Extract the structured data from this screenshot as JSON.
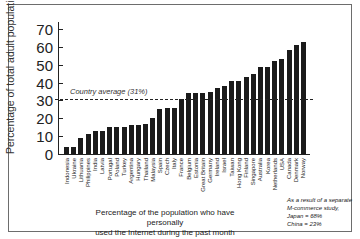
{
  "chart_data": {
    "type": "bar",
    "title": "",
    "xlabel": "Percentage of the population who have personally used the Internet during the past month",
    "xlabel_lines": [
      "Percentage of the population who have personally",
      "used the Internet during the past month"
    ],
    "ylabel": "Percentage of total adult population",
    "ylim": [
      0,
      70
    ],
    "yticks": [
      0,
      10,
      20,
      30,
      40,
      50,
      60,
      70
    ],
    "grid": false,
    "categories": [
      "Indonesia",
      "Ukraine",
      "Lithuania",
      "Philippines",
      "India",
      "Latvia",
      "Portugal",
      "Poland",
      "Turkey",
      "Argentina",
      "Hungary",
      "Thailand",
      "Malaysia",
      "Spain",
      "Czech",
      "Italy",
      "France",
      "Belgium",
      "Estonia",
      "Great Britain",
      "Germany",
      "Ireland",
      "Israel",
      "Taiwan",
      "Hong Kong",
      "Finland",
      "Singapore",
      "Australia",
      "Korea",
      "Netherlands",
      "USA",
      "Canada",
      "Denmark",
      "Norway"
    ],
    "values": [
      4,
      4,
      9,
      11,
      13,
      13,
      15,
      15,
      15,
      16,
      16,
      17,
      20,
      25,
      26,
      26,
      31,
      34,
      34,
      34,
      35,
      37,
      38,
      41,
      41,
      43,
      45,
      49,
      49,
      52,
      53,
      58,
      61,
      63
    ],
    "annotations": [
      {
        "type": "hline",
        "y": 31,
        "style": "dashed",
        "label": "Country average (31%)"
      }
    ],
    "footnote": {
      "lines": [
        "As a result of a separate",
        "M-commerce study,",
        "Japan = 68%",
        "China = 23%"
      ]
    },
    "bar_color": "#1b1b1b"
  }
}
